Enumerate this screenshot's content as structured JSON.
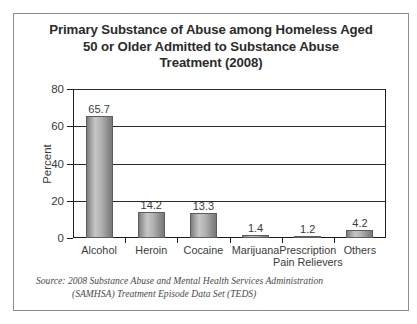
{
  "figure": {
    "title_lines": [
      "Primary Substance of Abuse among Homeless Aged",
      "50 or Older Admitted to Substance Abuse",
      "Treatment (2008)"
    ],
    "source_lines": [
      "Source: 2008 Substance Abuse and Mental Health Services Administration",
      "(SAMHSA) Treatment Episode Data Set (TEDS)"
    ]
  },
  "chart_data": {
    "type": "bar",
    "title": "Primary Substance of Abuse among Homeless Aged 50 or Older Admitted to Substance Abuse Treatment (2008)",
    "categories": [
      "Alcohol",
      "Heroin",
      "Cocaine",
      "Marijuana",
      "Prescription Pain Relievers",
      "Others"
    ],
    "category_label_lines": [
      [
        "Alcohol"
      ],
      [
        "Heroin"
      ],
      [
        "Cocaine"
      ],
      [
        "Marijuana"
      ],
      [
        "Prescription",
        "Pain Relievers"
      ],
      [
        "Others"
      ]
    ],
    "values": [
      65.7,
      14.2,
      13.3,
      1.4,
      1.2,
      4.2
    ],
    "value_labels": [
      "65.7",
      "14.2",
      "13.3",
      "1.4",
      "1.2",
      "4.2"
    ],
    "xlabel": "",
    "ylabel": "Percent",
    "ylim": [
      0,
      80
    ],
    "yticks": [
      0,
      20,
      40,
      60,
      80
    ],
    "ytick_labels": [
      "0",
      "20",
      "40",
      "60",
      "80"
    ],
    "grid": "horizontal",
    "legend": "none",
    "bar_color": "#a8a8a8",
    "bar_edge_color": "#5d5d5d",
    "text_color": "#3a3a3a"
  }
}
